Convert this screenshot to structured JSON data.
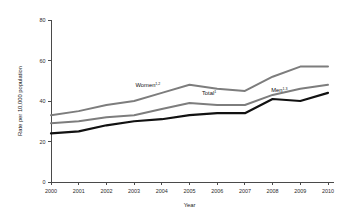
{
  "chart_data": {
    "type": "line",
    "title": "",
    "xlabel": "Year",
    "ylabel": "Rate per 10,000 population",
    "x": [
      2000,
      2001,
      2002,
      2003,
      2004,
      2005,
      2006,
      2007,
      2008,
      2009,
      2010
    ],
    "xtick_labels": [
      "2000",
      "2001",
      "2002",
      "2003",
      "2004",
      "2005",
      "2006",
      "2007",
      "2008",
      "2009",
      "2010"
    ],
    "ytick_labels": [
      "0",
      "20",
      "40",
      "60",
      "80"
    ],
    "yticks": [
      0,
      20,
      40,
      60,
      80
    ],
    "ylim": [
      0,
      80
    ],
    "xlim": [
      2000,
      2010
    ],
    "grid": false,
    "legend_position": "inline-annotations",
    "series": [
      {
        "name": "Women",
        "annotation_label": "Women",
        "annotation_superscript": "1,2",
        "color": "#7d7d7d",
        "line_width": 2.0,
        "values": [
          33,
          35,
          38,
          40,
          44,
          48,
          46,
          45,
          52,
          57,
          57
        ]
      },
      {
        "name": "Total",
        "annotation_label": "Total",
        "annotation_superscript": "1",
        "color": "#7d7d7d",
        "line_width": 2.0,
        "values": [
          29,
          30,
          32,
          33,
          36,
          39,
          38,
          38,
          43,
          46,
          48
        ]
      },
      {
        "name": "Men",
        "annotation_label": "Men",
        "annotation_superscript": "1,3",
        "color": "#111111",
        "line_width": 2.2,
        "values": [
          24,
          25,
          28,
          30,
          31,
          33,
          34,
          34,
          41,
          40,
          44
        ]
      }
    ],
    "annotations": [
      {
        "text": "Women",
        "superscript": "1,2",
        "x": 2003.05,
        "y": 47.0
      },
      {
        "text": "Total",
        "superscript": "1",
        "x": 2005.45,
        "y": 43.0
      },
      {
        "text": "Men",
        "superscript": "1,3",
        "x": 2007.95,
        "y": 44.5
      }
    ]
  }
}
